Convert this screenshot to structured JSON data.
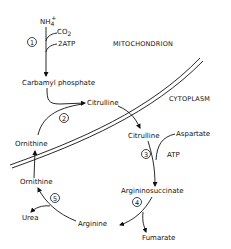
{
  "compartments": {
    "mitochondrion": "MITOCHONDRION",
    "cytoplasm": "CYTOPLASM"
  },
  "metabolites": {
    "nh4": "NH",
    "nh4_sub": "4",
    "nh4_sup": "+",
    "co2": "CO",
    "co2_sub": "2",
    "atp2": "2ATP",
    "carbamyl_phosphate": "Carbamyl phosphate",
    "citrulline_mito": "Citrulline",
    "ornithine_mito": "Ornithine",
    "citrulline_cyto": "Citrulline",
    "aspartate": "Aspartate",
    "atp": "ATP",
    "argininosuccinate": "Argininosuccinate",
    "fumarate": "Fumarate",
    "arginine": "Arginine",
    "urea": "Urea",
    "ornithine_cyto": "Ornithine"
  },
  "steps": [
    "1",
    "2",
    "3",
    "4",
    "5"
  ]
}
